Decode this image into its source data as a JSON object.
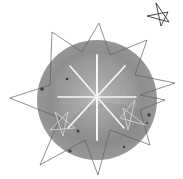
{
  "image": {
    "description": "Watercolor gray circle with white eight-pointed starburst, sketched star outlines and a small hand-drawn star",
    "colors": {
      "background": "#ffffff",
      "circle_outer": "#8a8a8a",
      "circle_inner": "#b0b0b0",
      "sparkle": "#f4f4f4",
      "lines": "#5a5a5a",
      "dots": "#3a3a3a"
    }
  }
}
